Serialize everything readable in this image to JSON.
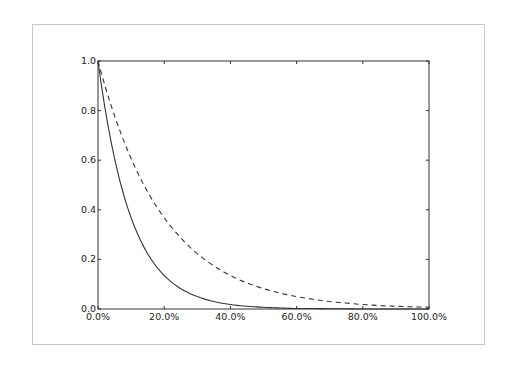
{
  "chart_data": {
    "type": "line",
    "title": "",
    "xlabel": "",
    "ylabel": "",
    "xlim": [
      0,
      100
    ],
    "ylim": [
      0.0,
      1.0
    ],
    "grid": false,
    "legend": null,
    "x_ticks": [
      "0.0%",
      "20.0%",
      "40.0%",
      "60.0%",
      "80.0%",
      "100.0%"
    ],
    "y_ticks": [
      "0.0",
      "0.2",
      "0.4",
      "0.6",
      "0.8",
      "1.0"
    ],
    "x": [
      0,
      5,
      10,
      15,
      20,
      25,
      30,
      35,
      40,
      45,
      50,
      55,
      60,
      65,
      70,
      75,
      80,
      85,
      90,
      95,
      100
    ],
    "series": [
      {
        "name": "solid",
        "style": "solid",
        "color": "#333333",
        "values": [
          1.0,
          0.607,
          0.368,
          0.223,
          0.135,
          0.082,
          0.05,
          0.03,
          0.018,
          0.011,
          0.007,
          0.004,
          0.002,
          0.002,
          0.001,
          0.001,
          0.0,
          0.0,
          0.0,
          0.0,
          0.0
        ]
      },
      {
        "name": "dashed",
        "style": "dashed",
        "color": "#333333",
        "values": [
          1.0,
          0.779,
          0.607,
          0.472,
          0.368,
          0.287,
          0.223,
          0.174,
          0.135,
          0.105,
          0.082,
          0.064,
          0.05,
          0.039,
          0.03,
          0.024,
          0.018,
          0.014,
          0.011,
          0.009,
          0.007
        ]
      }
    ]
  }
}
